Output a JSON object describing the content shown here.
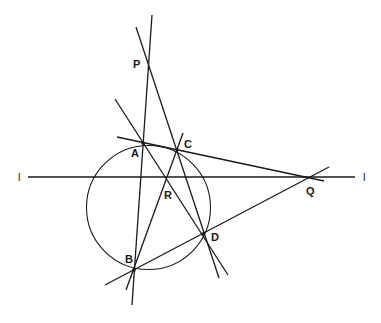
{
  "diagram": {
    "title": "",
    "labels": {
      "P": "P",
      "A": "A",
      "B": "B",
      "C": "C",
      "D": "D",
      "Q": "Q",
      "R": "R",
      "l_left": "l",
      "l_right": "l"
    },
    "points": {
      "P": [
        149,
        67
      ],
      "A": [
        143,
        143
      ],
      "B": [
        134,
        270
      ],
      "C": [
        177,
        150
      ],
      "D": [
        203,
        234
      ],
      "Q": [
        309,
        177
      ],
      "R": [
        166,
        178
      ]
    },
    "circle": {
      "cx": 148.5,
      "cy": 207.5,
      "r": 62
    },
    "lines": [
      {
        "name": "line-PAB",
        "from": [
          152,
          15
        ],
        "to": [
          132,
          305
        ]
      },
      {
        "name": "line-PCD",
        "from": [
          136,
          27
        ],
        "to": [
          219,
          278
        ]
      },
      {
        "name": "line-ARD",
        "from": [
          115,
          99
        ],
        "to": [
          228,
          275
        ]
      },
      {
        "name": "line-BRC",
        "from": [
          126,
          290
        ],
        "to": [
          183,
          133
        ]
      },
      {
        "name": "line-ACQ",
        "from": [
          117,
          137
        ],
        "to": [
          324,
          181
        ]
      },
      {
        "name": "line-BDQ",
        "from": [
          105,
          285
        ],
        "to": [
          329,
          167
        ]
      },
      {
        "name": "line-l",
        "from": [
          28,
          177
        ],
        "to": [
          355,
          177
        ]
      }
    ],
    "stroke_color": "#1a1a1a",
    "background": "#ffffff"
  }
}
